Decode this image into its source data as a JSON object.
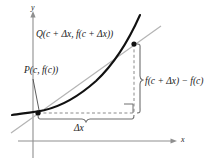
{
  "figure": {
    "type": "calculus-secant-line-diagram",
    "background_color": "#ffffff"
  },
  "axes": {
    "y_label": "y",
    "x_label": "x",
    "origin": {
      "x": 33,
      "y": 141
    },
    "color": "#8a8a8a"
  },
  "labels": {
    "point_p": "P(c, f(c))",
    "point_q": "Q(c + Δx, f(c + Δx))",
    "delta_x": "Δx",
    "difference": "f(c + Δx) − f(c)"
  },
  "points": [
    {
      "name": "P",
      "x": 38,
      "y": 113,
      "label": "P(c, f(c))"
    },
    {
      "name": "Q",
      "x": 134,
      "y": 44,
      "label": "Q(c + Δx, f(c + Δx))"
    }
  ],
  "curve": {
    "name": "function-curve",
    "color": "#111111",
    "stroke_width": 2.1,
    "path": "M 12,115 C 22,113.4 32,112.6 44,110.2 C 60,106.6 78,97 96,81 C 112,66 128,42 140,15"
  },
  "secant": {
    "name": "secant-line",
    "color": "#b0b0b0",
    "stroke_width": 1.1,
    "x1": 11,
    "y1": 133,
    "x2": 161,
    "y2": 26
  },
  "guides": {
    "horizontal_dashed": {
      "x1": 38,
      "y1": 113,
      "x2": 134,
      "y2": 113
    },
    "vertical_dashed": {
      "x1": 134,
      "y1": 44,
      "x2": 134,
      "y2": 113
    },
    "color": "#8a8a8a",
    "dash": "3,2.4"
  },
  "right_angle_marker": {
    "x": 124,
    "y": 104,
    "size": 9
  },
  "braces": {
    "horizontal": {
      "from": 38,
      "to": 134,
      "y": 118,
      "label": "Δx"
    },
    "vertical": {
      "from": 44,
      "to": 113,
      "x": 141,
      "label": "f(c + Δx) − f(c)"
    },
    "color": "#6e6e6e"
  },
  "leader_line": {
    "x1": 33,
    "y1": 79,
    "x2": 39,
    "y2": 110,
    "color": "#4a4a4a"
  }
}
